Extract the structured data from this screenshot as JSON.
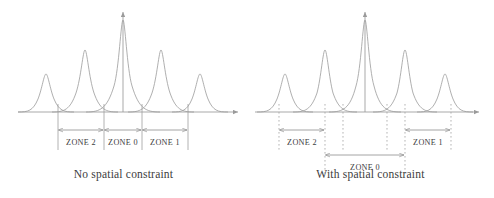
{
  "figure": {
    "type": "two-panel-diagram",
    "background": "#ffffff",
    "line_color": "#9a9a9a",
    "text_color": "#3c3c3c",
    "panels": [
      {
        "id": "left",
        "caption": "No spatial constraint",
        "guide_style": "solid",
        "axis": {
          "baseline_y": 112,
          "origin_x": 123,
          "x_axis_from": 18,
          "x_axis_to": 238,
          "y_axis_top": 12,
          "arrow_x": true,
          "arrow_y": true
        },
        "peaks": [
          {
            "center": 46,
            "height": 38,
            "width": 13
          },
          {
            "center": 85,
            "height": 62,
            "width": 17
          },
          {
            "center": 123,
            "height": 92,
            "width": 22
          },
          {
            "center": 161,
            "height": 62,
            "width": 17
          },
          {
            "center": 200,
            "height": 38,
            "width": 13
          }
        ],
        "guides": [
          58,
          104,
          142,
          188
        ],
        "zones": [
          {
            "label": "ZONE 2",
            "x_start": 58,
            "x_end": 104,
            "y": 130,
            "label_y": 145
          },
          {
            "label": "ZONE 0",
            "x_start": 104,
            "x_end": 142,
            "y": 130,
            "label_y": 145
          },
          {
            "label": "ZONE 1",
            "x_start": 142,
            "x_end": 188,
            "y": 130,
            "label_y": 145
          }
        ]
      },
      {
        "id": "right",
        "caption": "With spatial constraint",
        "guide_style": "dotted",
        "axis": {
          "baseline_y": 112,
          "origin_x": 118,
          "x_axis_from": 8,
          "x_axis_to": 228,
          "y_axis_top": 12,
          "arrow_x": true,
          "arrow_y": true
        },
        "peaks": [
          {
            "center": 38,
            "height": 38,
            "width": 12
          },
          {
            "center": 78,
            "height": 62,
            "width": 16
          },
          {
            "center": 118,
            "height": 92,
            "width": 21
          },
          {
            "center": 158,
            "height": 62,
            "width": 16
          },
          {
            "center": 198,
            "height": 38,
            "width": 12
          }
        ],
        "guides": [
          32,
          78,
          96,
          140,
          158,
          204
        ],
        "zones": [
          {
            "label": "ZONE 2",
            "x_start": 32,
            "x_end": 78,
            "y": 130,
            "label_y": 145
          },
          {
            "label": "ZONE 1",
            "x_start": 158,
            "x_end": 204,
            "y": 130,
            "label_y": 145
          },
          {
            "label": "ZONE 0",
            "x_start": 78,
            "x_end": 158,
            "y": 155,
            "label_y": 170
          }
        ]
      }
    ]
  },
  "labels": {
    "zone_0": "ZONE 0",
    "zone_1": "ZONE 1",
    "zone_2": "ZONE 2"
  },
  "captions": {
    "left": "No spatial constraint",
    "right": "With spatial constraint"
  }
}
